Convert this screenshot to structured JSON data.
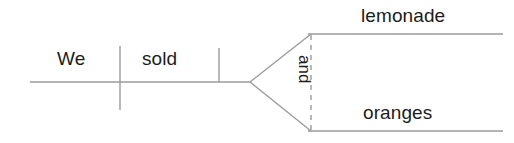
{
  "diagram": {
    "type": "reed-kellogg-sentence-diagram",
    "sentence": "We sold lemonade and oranges",
    "line_color": "#9b9b9b",
    "text_color": "#1c1c1c",
    "background_color": "#ffffff",
    "labels": {
      "subject": "We",
      "verb": "sold",
      "direct_object_1": "lemonade",
      "conjunction": "and",
      "direct_object_2": "oranges"
    },
    "parts": {
      "baseline_name": "main-baseline",
      "subject_verb_divider_name": "subject-verb-divider",
      "verb_object_divider_name": "verb-object-divider",
      "conjunction_line_name": "conjunction-dashed-line",
      "upper_branch_name": "compound-object-upper-branch",
      "lower_branch_name": "compound-object-lower-branch"
    }
  }
}
